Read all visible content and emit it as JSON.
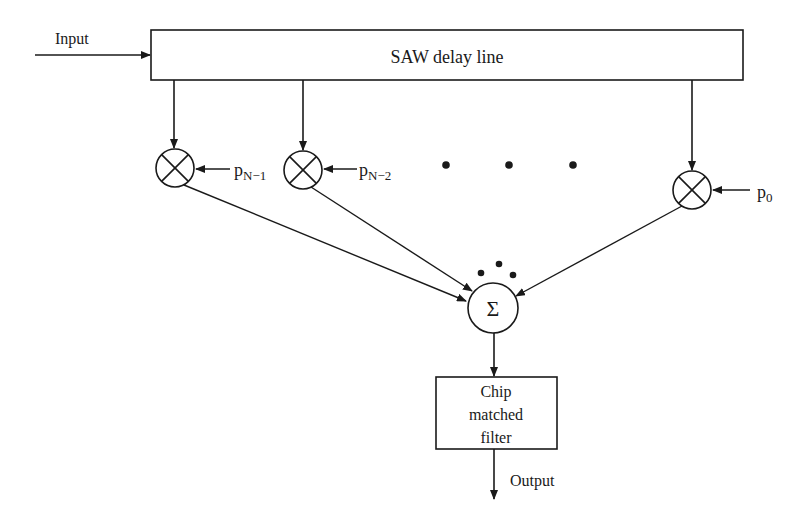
{
  "diagram": {
    "type": "block-diagram",
    "colors": {
      "stroke": "#1a1a1a",
      "background": "#ffffff"
    },
    "input_label": "Input",
    "delay_line_label": "SAW delay line",
    "taps": [
      {
        "coefficient_base": "p",
        "coefficient_sub": "N−1",
        "operator": "multiply"
      },
      {
        "coefficient_base": "p",
        "coefficient_sub": "N−2",
        "operator": "multiply"
      },
      {
        "coefficient_base": "p",
        "coefficient_sub": "0",
        "operator": "multiply"
      }
    ],
    "ellipsis_between_taps": "• • •",
    "summer_symbol": "Σ",
    "filter_label_lines": [
      "Chip",
      "matched",
      "filter"
    ],
    "output_label": "Output"
  }
}
